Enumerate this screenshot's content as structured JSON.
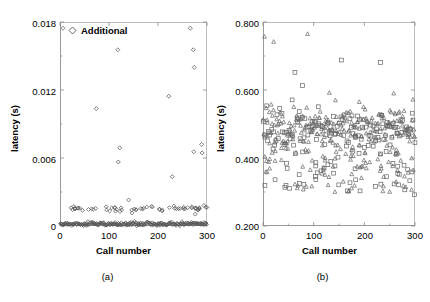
{
  "figure": {
    "caption_a": "(a)",
    "caption_b": "(b)"
  },
  "panel_a": {
    "legend_label": "Additional",
    "legend_marker": "diamond-icon",
    "ylabel": "latency (s)",
    "xlabel": "Call number",
    "ytick_labels": [
      "0",
      "0.006",
      "0.012",
      "0.018"
    ],
    "xtick_labels": [
      "0",
      "100",
      "200",
      "300"
    ]
  },
  "panel_b": {
    "legend_label": "With CACA",
    "legend_marker": "triangle-icon",
    "ylabel": "latency (s)",
    "xlabel": "Call number",
    "ytick_labels": [
      "0.200",
      "0.400",
      "0.600",
      "0.800"
    ],
    "xtick_labels": [
      "0",
      "100",
      "200",
      "300"
    ]
  },
  "chart_data": [
    {
      "type": "scatter",
      "panel": "(a)",
      "title": "",
      "xlabel": "Call number",
      "ylabel": "latency (s)",
      "xlim": [
        0,
        300
      ],
      "ylim": [
        0,
        0.018
      ],
      "xticks": [
        0,
        100,
        200,
        300
      ],
      "yticks": [
        0,
        0.006,
        0.012,
        0.018
      ],
      "minor_ticks": true,
      "grid": false,
      "legend": [
        "Additional"
      ],
      "legend_position": "top-left-inside",
      "marker": "open-diamond",
      "marker_color": "#555555",
      "description": "Latency of additional calls. Most points form a dense baseline band near 0 s, a secondary sparser band near 0.0015 s, plus a small number of large outliers scattered up to 0.0175 s.",
      "series": [
        {
          "name": "Additional",
          "marker": "open-diamond",
          "baseline_band": {
            "y_mean": 0.00018,
            "y_spread": 0.00015,
            "n_points": 250
          },
          "secondary_band": {
            "y_mean": 0.00155,
            "y_spread": 0.00012,
            "n_points": 62
          },
          "outliers": [
            {
              "x": 6,
              "y": 0.01745
            },
            {
              "x": 74,
              "y": 0.01035
            },
            {
              "x": 118,
              "y": 0.01555
            },
            {
              "x": 119,
              "y": 0.00565
            },
            {
              "x": 122,
              "y": 0.0069
            },
            {
              "x": 140,
              "y": 0.0023
            },
            {
              "x": 147,
              "y": 0.00115
            },
            {
              "x": 222,
              "y": 0.01145
            },
            {
              "x": 229,
              "y": 0.00435
            },
            {
              "x": 266,
              "y": 0.01745
            },
            {
              "x": 272,
              "y": 0.01555
            },
            {
              "x": 274,
              "y": 0.014
            },
            {
              "x": 273,
              "y": 0.00655
            },
            {
              "x": 289,
              "y": 0.0072
            },
            {
              "x": 290,
              "y": 0.00645
            },
            {
              "x": 276,
              "y": 0.00105
            }
          ]
        }
      ]
    },
    {
      "type": "scatter",
      "panel": "(b)",
      "title": "",
      "xlabel": "Call number",
      "ylabel": "latency (s)",
      "xlim": [
        0,
        300
      ],
      "ylim": [
        0.2,
        0.8
      ],
      "xticks": [
        0,
        100,
        200,
        300
      ],
      "yticks": [
        0.2,
        0.4,
        0.6,
        0.8
      ],
      "minor_ticks": true,
      "grid": false,
      "legend": [
        "With CACA"
      ],
      "legend_position": "top-right-inside",
      "marker": "open-triangle",
      "marker_color": "#666666",
      "description": "Latency with CACA. A dense main cluster centred near 0.480 s spanning roughly 0.44-0.56 s, a sparse lower scatter between 0.30 and 0.42 s, and a few high outliers between 0.60 and 0.77 s. Two marker types are plotted: open triangles and open squares.",
      "series": [
        {
          "name": "With CACA (triangles)",
          "marker": "open-triangle",
          "main_cluster": {
            "y_mean": 0.482,
            "y_spread": 0.035,
            "n_points": 230
          },
          "lower_scatter": {
            "y_min": 0.3,
            "y_max": 0.42,
            "n_points": 70
          },
          "outliers": [
            {
              "x": 3,
              "y": 0.757
            },
            {
              "x": 21,
              "y": 0.742
            },
            {
              "x": 88,
              "y": 0.765
            },
            {
              "x": 131,
              "y": 0.592
            },
            {
              "x": 143,
              "y": 0.57
            },
            {
              "x": 190,
              "y": 0.565
            },
            {
              "x": 258,
              "y": 0.59
            },
            {
              "x": 296,
              "y": 0.572
            }
          ]
        },
        {
          "name": "With CACA (squares)",
          "marker": "open-square",
          "main_cluster": {
            "y_mean": 0.478,
            "y_spread": 0.034,
            "n_points": 120
          },
          "lower_scatter": {
            "y_min": 0.3,
            "y_max": 0.425,
            "n_points": 45
          },
          "outliers": [
            {
              "x": 63,
              "y": 0.652
            },
            {
              "x": 78,
              "y": 0.613
            },
            {
              "x": 155,
              "y": 0.688
            },
            {
              "x": 232,
              "y": 0.681
            },
            {
              "x": 299,
              "y": 0.292
            }
          ]
        }
      ]
    }
  ]
}
